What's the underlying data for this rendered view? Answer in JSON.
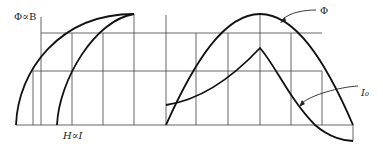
{
  "diagram": {
    "left_panel": {
      "y_axis_label": "Φ∝B",
      "x_axis_label": "H∝I",
      "curves": [
        "magnetization-rising-branch",
        "magnetization-falling-branch"
      ]
    },
    "right_panel": {
      "curves": [
        {
          "name": "flux",
          "label": "Φ"
        },
        {
          "name": "no-load-current",
          "label": "I₀"
        }
      ]
    },
    "colors": {
      "line": "#111111",
      "grid": "#555555",
      "background": "#ffffff"
    }
  }
}
